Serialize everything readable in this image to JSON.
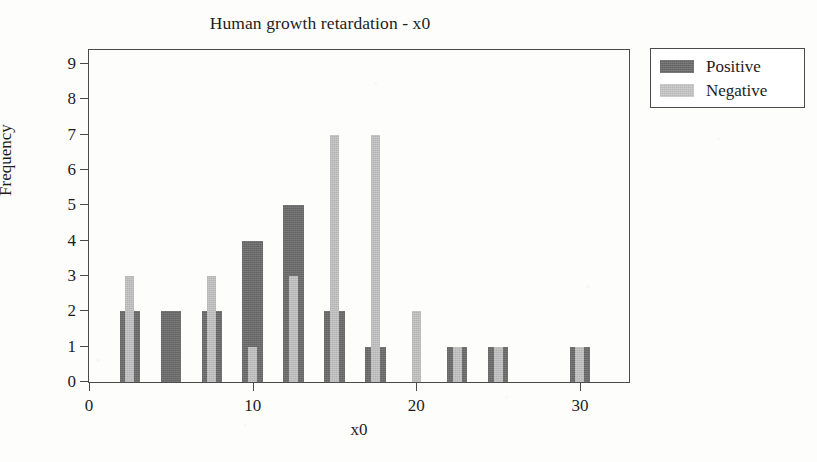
{
  "chart_data": {
    "type": "bar",
    "title": "Human growth retardation - x0",
    "xlabel": "x0",
    "ylabel": "Frequency",
    "xlim": [
      0,
      33
    ],
    "ylim": [
      0,
      9.4
    ],
    "grid": false,
    "legend_position": "top-right-outside",
    "x_ticks": [
      0,
      10,
      20,
      30
    ],
    "x_tick_labels": [
      "0",
      "10",
      "20",
      "30"
    ],
    "y_ticks": [
      0,
      1,
      2,
      3,
      4,
      5,
      6,
      7,
      8,
      9
    ],
    "y_tick_labels": [
      "0",
      "1",
      "2",
      "3",
      "4",
      "5",
      "6",
      "7",
      "8",
      "9"
    ],
    "x": [
      2.5,
      5,
      7.5,
      10,
      12.5,
      15,
      17.5,
      20,
      22.5,
      25,
      30
    ],
    "series": [
      {
        "name": "Positive",
        "color": "#6b6b6b",
        "bar_width_units": 1.25,
        "values": [
          2,
          2,
          2,
          4,
          5,
          2,
          1,
          0,
          1,
          1,
          1
        ]
      },
      {
        "name": "Negative",
        "color": "#bdbdbd",
        "bar_width_units": 0.55,
        "values": [
          3,
          0,
          3,
          1,
          3,
          7,
          7,
          2,
          1,
          1,
          1
        ]
      }
    ]
  },
  "legend": {
    "entries": [
      {
        "label": "Positive",
        "swatch_class": "pos"
      },
      {
        "label": "Negative",
        "swatch_class": "neg"
      }
    ]
  }
}
